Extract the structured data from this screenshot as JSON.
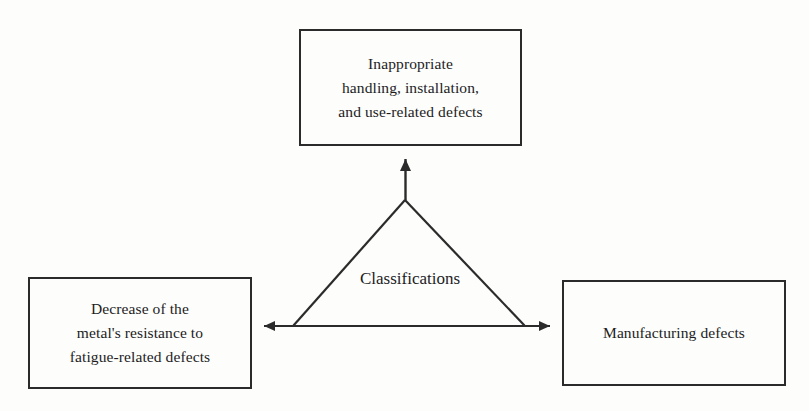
{
  "diagram": {
    "title": "Classifications",
    "center_label": "Classifications",
    "background_color": "#fdfdfc",
    "line_color": "#2b2b2b",
    "text_color": "#1c1c1c",
    "nodes": [
      {
        "id": "top",
        "name": "inappropriate-handling-node",
        "text": "Inappropriate\nhandling, installation,\nand use-related defects"
      },
      {
        "id": "left",
        "name": "fatigue-defects-node",
        "text": "Decrease of the\nmetal's resistance to\nfatigue-related defects"
      },
      {
        "id": "right",
        "name": "manufacturing-defects-node",
        "text": "Manufacturing defects"
      }
    ],
    "connectors": [
      {
        "id": "vertical-arrow",
        "from": "triangle-apex",
        "to": "top",
        "heads": "single-up"
      },
      {
        "id": "horizontal-arrow",
        "from": "left",
        "to": "right",
        "heads": "double"
      },
      {
        "id": "triangle-left-leg",
        "from": "triangle-apex",
        "to": "horizontal-arrow-left-base",
        "heads": "none"
      },
      {
        "id": "triangle-right-leg",
        "from": "triangle-apex",
        "to": "horizontal-arrow-right-base",
        "heads": "none"
      }
    ]
  }
}
